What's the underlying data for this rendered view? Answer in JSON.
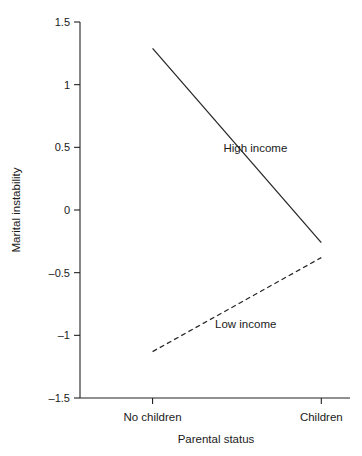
{
  "clipped_header_text": "",
  "chart_data": {
    "type": "line",
    "title": "",
    "xlabel": "Parental status",
    "ylabel": "Marital instability",
    "categories": [
      "No children",
      "Children"
    ],
    "x_positions": [
      0,
      1
    ],
    "xlim": [
      -0.43,
      1.17
    ],
    "ylim": [
      -1.5,
      1.5
    ],
    "grid": false,
    "legend": "inline annotations",
    "y_ticks": [
      {
        "value": 1.5,
        "label": "1.5"
      },
      {
        "value": 1,
        "label": "1"
      },
      {
        "value": 0.5,
        "label": "0.5"
      },
      {
        "value": 0,
        "label": "0"
      },
      {
        "value": -0.5,
        "label": "–0.5"
      },
      {
        "value": -1,
        "label": "–1"
      },
      {
        "value": -1.5,
        "label": "–1.5"
      }
    ],
    "series": [
      {
        "name": "High income",
        "style": "solid",
        "color": "#262626",
        "values": [
          1.29,
          -0.26
        ],
        "label_x": 0.42,
        "label_y": 0.46
      },
      {
        "name": "Low income",
        "style": "dashed",
        "color": "#262626",
        "values": [
          -1.13,
          -0.38
        ],
        "label_x": 0.37,
        "label_y": -0.94
      }
    ]
  }
}
